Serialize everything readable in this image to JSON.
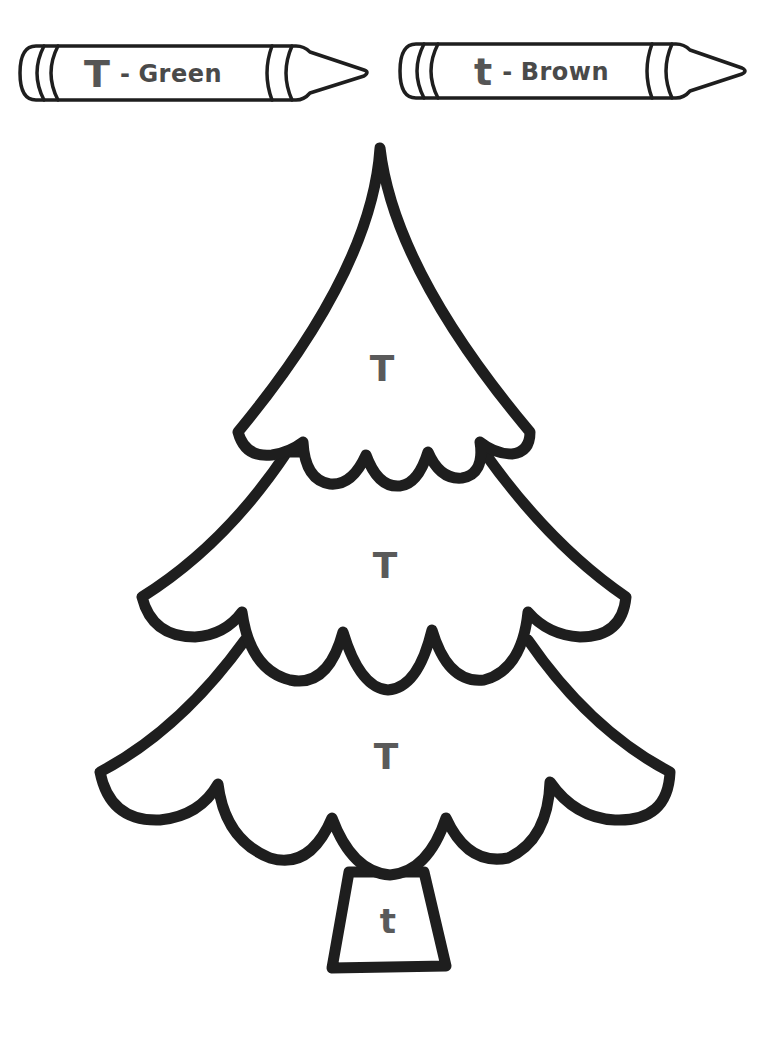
{
  "worksheet": {
    "type": "color-by-letter",
    "colors": {
      "outline": "#1e1e1e",
      "letter_text": "#555555",
      "background": "#ffffff"
    }
  },
  "key": [
    {
      "letter": "T",
      "separator": "-",
      "color_name": "Green"
    },
    {
      "letter": "t",
      "separator": "-",
      "color_name": "Brown"
    }
  ],
  "tree": {
    "regions": [
      {
        "name": "top-tier",
        "letter": "T"
      },
      {
        "name": "middle-tier",
        "letter": "T"
      },
      {
        "name": "bottom-tier",
        "letter": "T"
      },
      {
        "name": "trunk",
        "letter": "t"
      }
    ]
  }
}
